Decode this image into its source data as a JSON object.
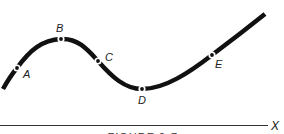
{
  "figure": {
    "caption": "FIGURE 2-7",
    "axis": {
      "label": "X"
    },
    "curve": {
      "color": "#111111",
      "description": "Wave-like curve rising to a maximum at B, falling through C to a minimum at D, then rising again through E"
    },
    "points": [
      {
        "id": "A",
        "label": "A"
      },
      {
        "id": "B",
        "label": "B"
      },
      {
        "id": "C",
        "label": "C"
      },
      {
        "id": "D",
        "label": "D"
      },
      {
        "id": "E",
        "label": "E"
      }
    ]
  }
}
